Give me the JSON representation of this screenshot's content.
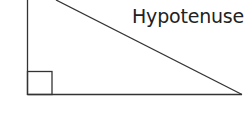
{
  "diagram": {
    "type": "right-triangle",
    "labels": {
      "hypotenuse": "Hypotenuse"
    },
    "right_angle_marker": true,
    "stroke_color": "#333333"
  }
}
